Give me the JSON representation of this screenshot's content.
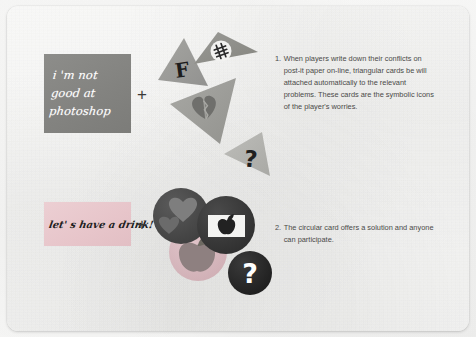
{
  "slide": {
    "background_color": "#f7f7f6",
    "page_color": "#fbfbfa"
  },
  "panels": {
    "photoshop": {
      "text": "i 'm not good at photoshop",
      "background_color": "#83837f",
      "text_color": "#ffffff"
    },
    "drink": {
      "text": "let' s have a drink!",
      "background_color": "#e7c5ca",
      "text_color": "#1f1f1f"
    }
  },
  "operators": {
    "plus_1": "+",
    "plus_2": "+"
  },
  "triangles": [
    {
      "id": "triangle-f",
      "icon": "letter-f-icon",
      "glyph": "F",
      "fill": "#9a9a96"
    },
    {
      "id": "triangle-money",
      "icon": "money-icon",
      "glyph": "$",
      "fill": "#8e8e8a"
    },
    {
      "id": "triangle-broken-heart",
      "icon": "broken-heart-icon",
      "glyph": "",
      "fill": "#9d9d99"
    },
    {
      "id": "triangle-question",
      "icon": "question-mark-icon",
      "glyph": "?",
      "fill": "#b4b4b0"
    }
  ],
  "circles": [
    {
      "id": "circle-hearts",
      "icon": "hearts-icon",
      "glyph": "",
      "fill": "#4b4b4b"
    },
    {
      "id": "circle-apple",
      "icon": "apple-logo-icon",
      "glyph": "",
      "fill": "#3c3c3c"
    },
    {
      "id": "circle-fruit",
      "icon": "apple-fruit-icon",
      "glyph": "",
      "fill": "#d8b9be"
    },
    {
      "id": "circle-question",
      "icon": "question-mark-icon",
      "glyph": "?",
      "fill": "#2b2b2b"
    }
  ],
  "captions": [
    {
      "number": "1.",
      "text": "When players write down their conflicts on post-it paper on-line, triangular cards be will attached automatically to the relevant problems. These cards are the symbolic icons of the player's worries."
    },
    {
      "number": "2.",
      "text": "The circular card offers  a solution and anyone can participate."
    }
  ]
}
